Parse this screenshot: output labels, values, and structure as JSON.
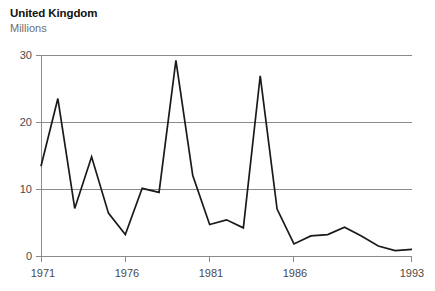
{
  "header": {
    "title": "United Kingdom",
    "subtitle": "Millions"
  },
  "colors": {
    "line": "#1a1a1a",
    "grid": "#8a8a8a",
    "title": "#111111",
    "subtitle": "#6e6e6e",
    "tick_label": "#4a4a4a",
    "background": "#ffffff"
  },
  "axes": {
    "y_ticks": [
      "0",
      "10",
      "20",
      "30"
    ],
    "x_ticks": [
      "1971",
      "1976",
      "1981",
      "1986",
      "1993"
    ]
  },
  "chart_data": {
    "type": "line",
    "title": "United Kingdom",
    "subtitle": "Millions",
    "xlabel": "",
    "ylabel": "Millions",
    "xlim": [
      1971,
      1993
    ],
    "ylim": [
      0,
      30
    ],
    "yticks": [
      0,
      10,
      20,
      30
    ],
    "xticks": [
      1971,
      1976,
      1981,
      1986,
      1993
    ],
    "grid": true,
    "legend": false,
    "x": [
      1971,
      1972,
      1973,
      1974,
      1975,
      1976,
      1977,
      1978,
      1979,
      1980,
      1981,
      1982,
      1983,
      1984,
      1985,
      1986,
      1987,
      1988,
      1989,
      1990,
      1991,
      1992,
      1993
    ],
    "values": [
      13.4,
      23.5,
      7.1,
      14.8,
      6.4,
      3.2,
      10.1,
      9.5,
      29.2,
      12.0,
      4.7,
      5.4,
      4.2,
      26.9,
      7.0,
      1.8,
      3.0,
      3.2,
      4.3,
      3.0,
      1.5,
      0.8,
      1.0
    ],
    "series": [
      {
        "name": "United Kingdom",
        "values": [
          13.4,
          23.5,
          7.1,
          14.8,
          6.4,
          3.2,
          10.1,
          9.5,
          29.2,
          12.0,
          4.7,
          5.4,
          4.2,
          26.9,
          7.0,
          1.8,
          3.0,
          3.2,
          4.3,
          3.0,
          1.5,
          0.8,
          1.0
        ]
      }
    ]
  },
  "geometry": {
    "plot_left": 41,
    "plot_right": 412,
    "plot_top": 55,
    "plot_bottom": 256
  }
}
